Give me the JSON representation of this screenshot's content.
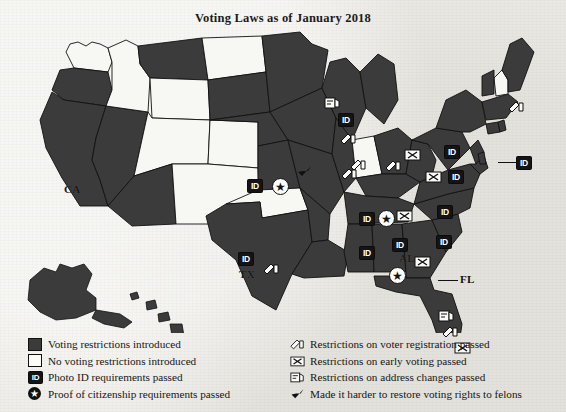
{
  "title": "Voting Laws as of January 2018",
  "colors": {
    "restricted_fill": "#3b3b3b",
    "unrestricted_fill": "#f7f7f4",
    "outline": "#111111",
    "paper": "#ecebe6",
    "badge": "#141414"
  },
  "legend": {
    "left": [
      {
        "icon": "filled-square-swatch",
        "label": "Voting restrictions introduced"
      },
      {
        "icon": "empty-square-swatch",
        "label": "No voting restrictions introduced"
      },
      {
        "icon": "photo-id-badge-icon",
        "label": "Photo ID requirements passed"
      },
      {
        "icon": "star-circle-icon",
        "label": "Proof of citizenship requirements passed"
      }
    ],
    "right": [
      {
        "icon": "voter-registration-icon",
        "label": "Restrictions on voter registration passed"
      },
      {
        "icon": "early-voting-ballot-icon",
        "label": "Restrictions on early voting passed"
      },
      {
        "icon": "address-change-icon",
        "label": "Restrictions on address changes passed"
      },
      {
        "icon": "felon-rights-arrow-icon",
        "label": "Made it harder to restore voting rights to felons"
      }
    ]
  },
  "map": {
    "state_labels": [
      {
        "name": "CA",
        "x": 64,
        "y": 155,
        "on_dark": true
      },
      {
        "name": "TX",
        "x": 239,
        "y": 240,
        "on_dark": true
      },
      {
        "name": "AL",
        "x": 399,
        "y": 224,
        "on_dark": true
      },
      {
        "name": "FL",
        "x": 460,
        "y": 245,
        "on_dark": false
      }
    ],
    "markers": [
      {
        "state": "WI",
        "icon": "photo-id-badge-icon",
        "x": 338,
        "y": 85
      },
      {
        "state": "WI",
        "icon": "address-change-icon",
        "x": 324,
        "y": 68
      },
      {
        "state": "WI",
        "icon": "voter-registration-icon",
        "x": 340,
        "y": 104
      },
      {
        "state": "IA",
        "icon": "felon-rights-arrow-icon",
        "x": 297,
        "y": 137
      },
      {
        "state": "IL",
        "icon": "voter-registration-icon",
        "x": 341,
        "y": 139
      },
      {
        "state": "KS",
        "icon": "photo-id-badge-icon",
        "x": 247,
        "y": 151
      },
      {
        "state": "KS",
        "icon": "star-circle-icon",
        "x": 272,
        "y": 150
      },
      {
        "state": "OH",
        "icon": "voter-registration-icon",
        "x": 385,
        "y": 131
      },
      {
        "state": "OH",
        "icon": "early-voting-ballot-icon",
        "x": 404,
        "y": 120
      },
      {
        "state": "IN",
        "icon": "voter-registration-icon",
        "x": 350,
        "y": 130
      },
      {
        "state": "WV",
        "icon": "early-voting-ballot-icon",
        "x": 425,
        "y": 142
      },
      {
        "state": "VA",
        "icon": "photo-id-badge-icon",
        "x": 444,
        "y": 117
      },
      {
        "state": "TN",
        "icon": "photo-id-badge-icon",
        "x": 359,
        "y": 184
      },
      {
        "state": "TN",
        "icon": "star-circle-icon",
        "x": 378,
        "y": 182
      },
      {
        "state": "TN",
        "icon": "early-voting-ballot-icon",
        "x": 396,
        "y": 181
      },
      {
        "state": "NC",
        "icon": "photo-id-badge-icon",
        "x": 437,
        "y": 177
      },
      {
        "state": "SC",
        "icon": "photo-id-badge-icon",
        "x": 436,
        "y": 207
      },
      {
        "state": "MS",
        "icon": "photo-id-badge-icon",
        "x": 359,
        "y": 218
      },
      {
        "state": "AL",
        "icon": "photo-id-badge-icon",
        "x": 392,
        "y": 210
      },
      {
        "state": "AL",
        "icon": "star-circle-icon",
        "x": 389,
        "y": 239
      },
      {
        "state": "GA",
        "icon": "early-voting-ballot-icon",
        "x": 414,
        "y": 227
      },
      {
        "state": "TX",
        "icon": "photo-id-badge-icon",
        "x": 238,
        "y": 224
      },
      {
        "state": "TX",
        "icon": "voter-registration-icon",
        "x": 263,
        "y": 234
      },
      {
        "state": "FL",
        "icon": "address-change-icon",
        "x": 438,
        "y": 281
      },
      {
        "state": "FL",
        "icon": "voter-registration-icon",
        "x": 442,
        "y": 297
      },
      {
        "state": "FL",
        "icon": "early-voting-ballot-icon",
        "x": 454,
        "y": 313
      },
      {
        "state": "ME",
        "icon": "voter-registration-icon",
        "x": 508,
        "y": 72
      },
      {
        "state": "PA",
        "icon": "photo-id-badge-icon",
        "x": 448,
        "y": 142
      },
      {
        "state": "RI",
        "icon": "photo-id-badge-icon",
        "x": 516,
        "y": 128
      }
    ],
    "states_restricted": [
      "CA",
      "OR",
      "NV",
      "MT",
      "WY",
      "AZ",
      "TX",
      "KS",
      "NE",
      "SD",
      "ND",
      "MN",
      "WI",
      "IA",
      "MO",
      "AR",
      "LA",
      "MS",
      "AL",
      "GA",
      "FL",
      "SC",
      "NC",
      "TN",
      "KY",
      "VA",
      "WV",
      "OH",
      "MI",
      "IL",
      "PA",
      "NY",
      "NJ",
      "MD",
      "DE",
      "CT",
      "MA",
      "VT",
      "ME",
      "AK",
      "HI",
      "RI"
    ],
    "states_unrestricted": [
      "WA",
      "ID",
      "UT",
      "CO",
      "NM",
      "OK",
      "IN",
      "NH"
    ]
  }
}
